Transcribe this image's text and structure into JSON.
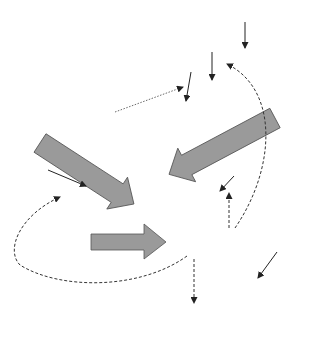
{
  "diagram": {
    "type": "coagulation-cascade",
    "nodes": {
      "xii": "XII",
      "xiia": "XIIa",
      "hk_pk": "HK PK",
      "xi": "XI",
      "xia": "XIa",
      "ix": "IX",
      "ixa": "IXa",
      "x_left": "X",
      "x_right": "X",
      "tissue_factor": "Tissue factor",
      "viia": "VIIa",
      "extrinsic_xase": "Extrinsic Xase",
      "intrinsic_xase": "Intrinsic Xase",
      "xa": "Xa",
      "v": "V",
      "va": "Va",
      "viii": "VIII",
      "viiia": "VIIIa",
      "prothrombin": "Prothrombin",
      "prothrombinase": "Prothrombinase",
      "thrombin": "Thrombin",
      "fibrinogen": "Fibrinogen",
      "fibrin_monomer": "Fibrin monomer",
      "fibrin_polymer": "Fibrin polymer",
      "xiii": "XIII",
      "xiiia": "XIIIa",
      "crosslinked_line1": "Cross-linked",
      "crosslinked_line2": "fibrin polymer"
    },
    "edges": [
      {
        "from": "XII",
        "to": "XIIa",
        "style": "solid"
      },
      {
        "from": "XI",
        "to": "XIa",
        "style": "solid"
      },
      {
        "from": "IX",
        "to": "IXa",
        "style": "solid"
      },
      {
        "from": "VIIa",
        "to": "IX",
        "style": "dotted"
      },
      {
        "from": "Extrinsic Xase",
        "to": "Xa",
        "style": "block-arrow"
      },
      {
        "from": "Intrinsic Xase",
        "to": "Xa",
        "style": "block-arrow"
      },
      {
        "from": "V",
        "to": "Va",
        "style": "solid"
      },
      {
        "from": "VIII",
        "to": "VIIIa",
        "style": "solid"
      },
      {
        "from": "Prothrombinase",
        "to": "Thrombin",
        "style": "block-arrow"
      },
      {
        "from": "Thrombin",
        "to": "VIIIa",
        "style": "dashed"
      },
      {
        "from": "Thrombin",
        "to": "XIa",
        "style": "dashed"
      },
      {
        "from": "Thrombin",
        "to": "Va",
        "style": "dashed"
      },
      {
        "from": "Thrombin",
        "to": "XIIIa",
        "style": "dashed"
      },
      {
        "from": "Fibrinogen",
        "to": "Fibrin monomer",
        "style": "solid"
      },
      {
        "from": "Fibrin monomer",
        "to": "Fibrin polymer",
        "style": "solid"
      },
      {
        "from": "XIII",
        "to": "XIIIa",
        "style": "solid"
      },
      {
        "from": "Fibrin polymer",
        "to": "Cross-linked fibrin polymer",
        "style": "solid"
      }
    ],
    "colors": {
      "light_box": "#e2e2e2",
      "dark_box": "#b4b4b4",
      "block_arrow": "#9a9a9a",
      "line": "#222222"
    }
  }
}
